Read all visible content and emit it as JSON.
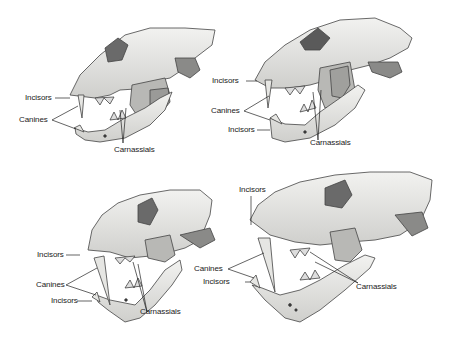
{
  "figure": {
    "panels": [
      {
        "id": "top-left",
        "labels": {
          "incisors_upper": "Incisors",
          "canines": "Canines",
          "carnassials": "Carnassials"
        }
      },
      {
        "id": "top-right",
        "labels": {
          "incisors_upper": "Incisors",
          "canines": "Canines",
          "incisors_lower": "Incisors",
          "carnassials": "Carnassials"
        }
      },
      {
        "id": "bottom-left",
        "labels": {
          "incisors_upper": "Incisors",
          "canines": "Canines",
          "incisors_lower": "Incisors",
          "carnassials": "Carnassials"
        }
      },
      {
        "id": "bottom-right",
        "labels": {
          "incisors_upper": "Incisors",
          "canines": "Canines",
          "incisors_lower": "Incisors",
          "carnassials": "Carnassials"
        }
      }
    ],
    "colors": {
      "bone": "#e8e8e6",
      "shade": "#9a9a98",
      "dark": "#555555",
      "line": "#333333"
    }
  }
}
